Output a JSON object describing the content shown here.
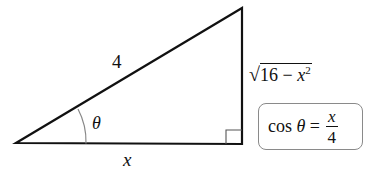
{
  "figure": {
    "type": "right-triangle",
    "hypotenuse_label": "4",
    "angle_label": "θ",
    "adjacent_label": "x",
    "opposite_label": {
      "radical": "√",
      "radicand_number": "16",
      "operator": "−",
      "variable": "x",
      "exponent": "2"
    },
    "identity": {
      "lhs_func": "cos",
      "lhs_var": "θ",
      "equals": "=",
      "numerator": "x",
      "denominator": "4"
    },
    "colors": {
      "stroke": "#111111",
      "angle_arc": "#888888",
      "box_border": "#8a8a8a",
      "background": "#ffffff"
    }
  }
}
